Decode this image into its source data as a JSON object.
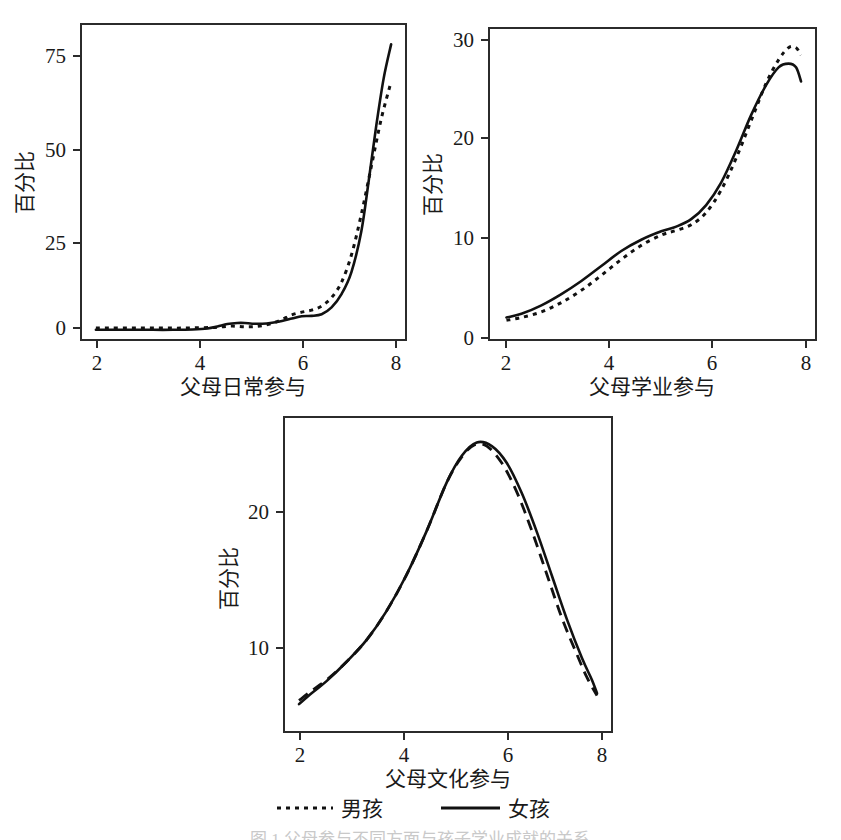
{
  "figure": {
    "caption": "图 1 父母参与不同方面与孩子学业成就的关系",
    "background": "#ffffff",
    "ink_color": "#111111"
  },
  "legend": {
    "position": "bottom-center",
    "entries": [
      {
        "label": "男孩",
        "style": "dotted",
        "meaning": "boys"
      },
      {
        "label": "女孩",
        "style": "solid",
        "meaning": "girls"
      }
    ]
  },
  "chart_data": [
    {
      "id": "panel-daily",
      "type": "line",
      "title": "",
      "xlabel": "父母日常参与",
      "ylabel": "百分比",
      "xlim": [
        1.75,
        8.3
      ],
      "ylim": [
        -3,
        90
      ],
      "xticks": [
        2,
        4,
        6,
        8
      ],
      "yticks": [
        0,
        25,
        50,
        75
      ],
      "xtick_labels": [
        "2",
        "4",
        "6",
        "8"
      ],
      "ytick_labels": [
        "0",
        "25",
        "50",
        "75"
      ],
      "grid": false,
      "series": [
        {
          "name": "男孩",
          "style": "dotted",
          "x": [
            2.05,
            2.3,
            2.6,
            2.9,
            3.2,
            3.5,
            3.8,
            4.1,
            4.4,
            4.6,
            4.8,
            5.0,
            5.2,
            5.4,
            5.6,
            5.8,
            6.0,
            6.2,
            6.4,
            6.6,
            6.8,
            7.0,
            7.2,
            7.4,
            7.6,
            7.8,
            8.0
          ],
          "y": [
            0.5,
            0.5,
            0.5,
            0.5,
            0.5,
            0.5,
            0.5,
            0.6,
            0.7,
            0.9,
            1.1,
            0.9,
            0.9,
            1.2,
            1.9,
            3.0,
            4.4,
            5.2,
            5.8,
            7.0,
            9.5,
            14.0,
            22.0,
            34.0,
            48.0,
            62.0,
            73.0
          ]
        },
        {
          "name": "女孩",
          "style": "solid",
          "x": [
            2.05,
            2.4,
            2.8,
            3.2,
            3.6,
            4.0,
            4.3,
            4.5,
            4.7,
            4.9,
            5.05,
            5.2,
            5.4,
            5.6,
            5.8,
            6.0,
            6.2,
            6.4,
            6.6,
            6.8,
            7.0,
            7.2,
            7.4,
            7.55,
            7.7,
            7.85,
            8.0
          ],
          "y": [
            0.0,
            0.0,
            0.0,
            0.0,
            0.0,
            0.1,
            0.4,
            1.0,
            1.7,
            2.0,
            2.0,
            1.8,
            1.8,
            2.1,
            2.6,
            3.3,
            4.0,
            4.1,
            4.6,
            6.6,
            10.5,
            17.0,
            29.0,
            44.0,
            60.0,
            74.0,
            84.0
          ]
        }
      ]
    },
    {
      "id": "panel-academic",
      "type": "line",
      "title": "",
      "xlabel": "父母学业参与",
      "ylabel": "百分比",
      "xlim": [
        1.75,
        8.3
      ],
      "ylim": [
        -0.8,
        32.5
      ],
      "xticks": [
        2,
        4,
        6,
        8
      ],
      "yticks": [
        0,
        10,
        20,
        30
      ],
      "xtick_labels": [
        "2",
        "4",
        "6",
        "8"
      ],
      "ytick_labels": [
        "0",
        "10",
        "20",
        "30"
      ],
      "grid": false,
      "series": [
        {
          "name": "男孩",
          "style": "dotted",
          "x": [
            2.1,
            2.4,
            2.8,
            3.2,
            3.6,
            4.0,
            4.4,
            4.8,
            5.2,
            5.5,
            5.8,
            6.1,
            6.4,
            6.7,
            7.0,
            7.3,
            7.55,
            7.75,
            7.9,
            8.0
          ],
          "y": [
            1.3,
            1.6,
            2.2,
            3.2,
            4.5,
            6.1,
            7.8,
            9.3,
            10.4,
            10.9,
            11.5,
            12.8,
            15.2,
            18.6,
            22.6,
            26.6,
            29.1,
            30.4,
            30.4,
            29.6
          ]
        },
        {
          "name": "女孩",
          "style": "solid",
          "x": [
            2.1,
            2.4,
            2.8,
            3.2,
            3.6,
            4.0,
            4.4,
            4.8,
            5.2,
            5.5,
            5.8,
            6.1,
            6.4,
            6.7,
            7.0,
            7.3,
            7.55,
            7.75,
            7.9,
            8.0
          ],
          "y": [
            1.6,
            2.0,
            2.9,
            4.1,
            5.5,
            7.1,
            8.7,
            9.9,
            10.8,
            11.3,
            12.1,
            13.6,
            16.0,
            19.4,
            23.2,
            26.4,
            28.3,
            28.7,
            28.3,
            26.8
          ]
        }
      ]
    },
    {
      "id": "panel-cultural",
      "type": "line",
      "title": "",
      "xlabel": "父母文化参与",
      "ylabel": "百分比",
      "xlim": [
        1.75,
        8.3
      ],
      "ylim": [
        2.0,
        28.0
      ],
      "xticks": [
        2,
        4,
        6,
        8
      ],
      "yticks": [
        10,
        20
      ],
      "xtick_labels": [
        "2",
        "4",
        "6",
        "8"
      ],
      "ytick_labels": [
        "10",
        "20"
      ],
      "grid": false,
      "series": [
        {
          "name": "男孩",
          "style": "dashed",
          "x": [
            2.05,
            2.3,
            2.6,
            3.0,
            3.4,
            3.8,
            4.2,
            4.6,
            5.0,
            5.3,
            5.55,
            5.8,
            6.1,
            6.4,
            6.7,
            7.0,
            7.3,
            7.6,
            7.8,
            8.0
          ],
          "y": [
            4.6,
            5.4,
            6.3,
            7.8,
            9.6,
            12.0,
            15.0,
            18.6,
            22.6,
            24.7,
            25.7,
            25.6,
            24.2,
            21.8,
            18.6,
            15.0,
            11.4,
            8.4,
            6.5,
            5.0
          ]
        },
        {
          "name": "女孩",
          "style": "solid",
          "x": [
            2.05,
            2.3,
            2.6,
            3.0,
            3.4,
            3.8,
            4.2,
            4.6,
            5.0,
            5.3,
            5.6,
            5.9,
            6.2,
            6.5,
            6.8,
            7.1,
            7.4,
            7.7,
            7.9,
            8.0
          ],
          "y": [
            4.3,
            5.2,
            6.2,
            7.8,
            9.6,
            12.0,
            15.0,
            18.6,
            22.6,
            24.8,
            25.9,
            25.6,
            24.2,
            21.7,
            18.5,
            14.9,
            11.3,
            8.1,
            6.3,
            5.2
          ]
        }
      ]
    }
  ]
}
